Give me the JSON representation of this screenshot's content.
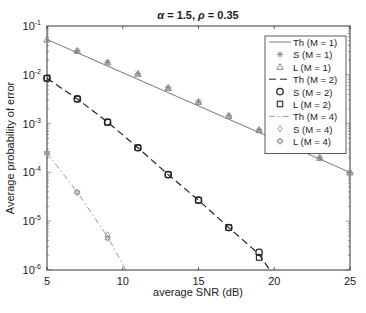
{
  "chart_data": {
    "type": "line",
    "title": "α = 1.5, ρ = 0.35",
    "title_parts": {
      "alpha": "α",
      "alpha_val": " = 1.5, ",
      "rho": "ρ",
      "rho_val": " = 0.35"
    },
    "xlabel": "average SNR (dB)",
    "ylabel": "Average probability of error",
    "xlim": [
      5,
      25
    ],
    "ylim": [
      1e-06,
      0.1
    ],
    "yscale": "log",
    "x_ticks": [
      5,
      10,
      15,
      20,
      25
    ],
    "y_ticks": [
      {
        "base": "10",
        "exp": "-1"
      },
      {
        "base": "10",
        "exp": "-2"
      },
      {
        "base": "10",
        "exp": "-3"
      },
      {
        "base": "10",
        "exp": "-4"
      },
      {
        "base": "10",
        "exp": "-5"
      },
      {
        "base": "10",
        "exp": "-6"
      }
    ],
    "grid": false,
    "legend_position": "upper right",
    "series": [
      {
        "name": "Th (M = 1)",
        "kind": "line",
        "style": "solid",
        "color": "#777777",
        "x": [
          5,
          25
        ],
        "y": [
          0.053,
          0.0001
        ]
      },
      {
        "name": "S (M = 1)",
        "kind": "marker",
        "marker": "asterisk",
        "color": "#888888",
        "x": [
          7,
          9,
          11,
          13,
          15,
          17,
          19,
          21,
          23,
          25
        ],
        "y": [
          0.031,
          0.018,
          0.0105,
          0.0054,
          0.0028,
          0.00145,
          0.00074,
          0.00039,
          0.0002,
          0.0001
        ]
      },
      {
        "name": "L (M = 1)",
        "kind": "marker",
        "marker": "triangle",
        "color": "#888888",
        "x": [
          5,
          7,
          9,
          11,
          13,
          15,
          17,
          19,
          21,
          23,
          25
        ],
        "y": [
          0.053,
          0.031,
          0.018,
          0.0105,
          0.0054,
          0.0028,
          0.00145,
          0.00074,
          0.00039,
          0.0002,
          0.0001
        ]
      },
      {
        "name": "Th (M = 2)",
        "kind": "line",
        "style": "dashed",
        "color": "#222222",
        "x": [
          5,
          7,
          9,
          11,
          13,
          15,
          17,
          19,
          19.7
        ],
        "y": [
          0.0085,
          0.0032,
          0.00107,
          0.00032,
          9e-05,
          2.7e-05,
          7.4e-06,
          2.1e-06,
          1e-06
        ]
      },
      {
        "name": "S (M = 2)",
        "kind": "marker",
        "marker": "circle",
        "color": "#222222",
        "x": [
          5,
          7,
          9,
          11,
          13,
          15,
          17,
          19
        ],
        "y": [
          0.0085,
          0.0032,
          0.00107,
          0.00032,
          9e-05,
          2.7e-05,
          7.4e-06,
          2.3e-06
        ]
      },
      {
        "name": "L (M = 2)",
        "kind": "marker",
        "marker": "square",
        "color": "#222222",
        "x": [
          5,
          7,
          9,
          11,
          13,
          15,
          17,
          19
        ],
        "y": [
          0.0085,
          0.0032,
          0.00107,
          0.00032,
          9e-05,
          2.7e-05,
          7.4e-06,
          1.8e-06
        ]
      },
      {
        "name": "Th (M = 4)",
        "kind": "line",
        "style": "dashdot",
        "color": "#999999",
        "x": [
          5,
          7,
          9,
          10.2
        ],
        "y": [
          0.00025,
          3.9e-05,
          4.8e-06,
          1e-06
        ]
      },
      {
        "name": "S (M = 4)",
        "kind": "marker",
        "marker": "diamond",
        "color": "#999999",
        "x": [
          5,
          7,
          9
        ],
        "y": [
          0.00025,
          3.9e-05,
          5.2e-06
        ]
      },
      {
        "name": "L (M = 4)",
        "kind": "marker",
        "marker": "hexagram",
        "color": "#999999",
        "x": [
          5,
          7,
          9
        ],
        "y": [
          0.00025,
          3.9e-05,
          4.5e-06
        ]
      }
    ],
    "legend": [
      {
        "label": "Th (M = 1)",
        "symbol": "solid-line"
      },
      {
        "label": "S (M = 1)",
        "symbol": "asterisk"
      },
      {
        "label": "L (M = 1)",
        "symbol": "triangle"
      },
      {
        "label": "Th (M = 2)",
        "symbol": "dashed-line"
      },
      {
        "label": "S (M = 2)",
        "symbol": "circle"
      },
      {
        "label": "L (M = 2)",
        "symbol": "square"
      },
      {
        "label": "Th (M = 4)",
        "symbol": "dashdot-line"
      },
      {
        "label": "S (M = 4)",
        "symbol": "diamond"
      },
      {
        "label": "L (M = 4)",
        "symbol": "hexagram"
      }
    ]
  }
}
